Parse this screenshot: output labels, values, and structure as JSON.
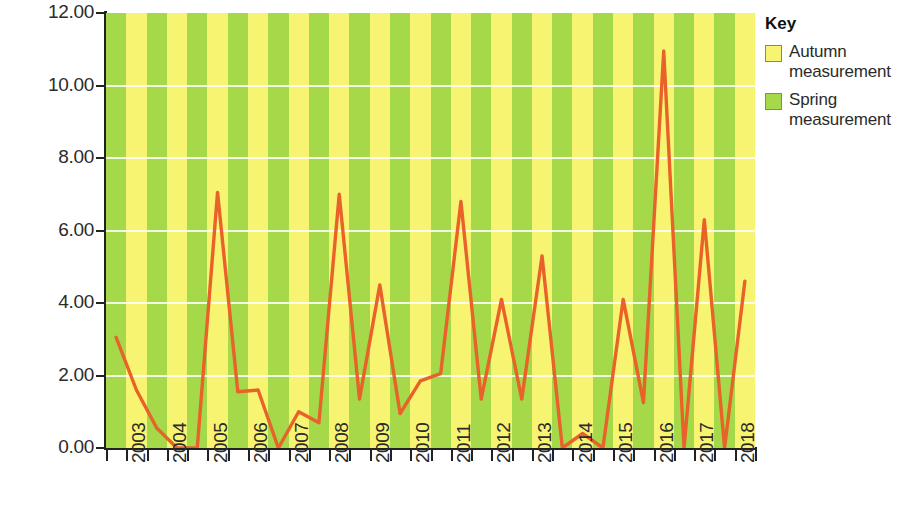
{
  "chart_data": {
    "type": "line",
    "title": "",
    "xlabel": "",
    "ylabel": "Erosion rate (metres per six months)",
    "ylim": [
      0,
      12
    ],
    "ytick_labels": [
      "12.00",
      "10.00",
      "8.00",
      "6.00",
      "4.00",
      "2.00",
      "0.00"
    ],
    "ytick_values": [
      12,
      10,
      8,
      6,
      4,
      2,
      0
    ],
    "xtick_labels": [
      "2003",
      "2004",
      "2005",
      "2006",
      "2007",
      "2008",
      "2009",
      "2010",
      "2011",
      "2012",
      "2013",
      "2014",
      "2015",
      "2016",
      "2017",
      "2018"
    ],
    "grid": true,
    "legend_position": "right",
    "line_color": "#e8622a",
    "band_colors": {
      "spring": "#a5d94a",
      "autumn": "#f7f472"
    },
    "season_order": [
      "Spring",
      "Autumn"
    ],
    "points": [
      {
        "year": "2003",
        "season": "Spring",
        "value": 3.05
      },
      {
        "year": "2003",
        "season": "Autumn",
        "value": 1.6
      },
      {
        "year": "2004",
        "season": "Spring",
        "value": 0.55
      },
      {
        "year": "2004",
        "season": "Autumn",
        "value": 0.0
      },
      {
        "year": "2005",
        "season": "Spring",
        "value": 0.0
      },
      {
        "year": "2005",
        "season": "Autumn",
        "value": 7.05
      },
      {
        "year": "2006",
        "season": "Spring",
        "value": 1.55
      },
      {
        "year": "2006",
        "season": "Autumn",
        "value": 1.6
      },
      {
        "year": "2007",
        "season": "Spring",
        "value": 0.0
      },
      {
        "year": "2007",
        "season": "Autumn",
        "value": 1.0
      },
      {
        "year": "2008",
        "season": "Spring",
        "value": 0.7
      },
      {
        "year": "2008",
        "season": "Autumn",
        "value": 7.0
      },
      {
        "year": "2009",
        "season": "Spring",
        "value": 1.35
      },
      {
        "year": "2009",
        "season": "Autumn",
        "value": 4.5
      },
      {
        "year": "2010",
        "season": "Spring",
        "value": 0.95
      },
      {
        "year": "2010",
        "season": "Autumn",
        "value": 1.85
      },
      {
        "year": "2011",
        "season": "Spring",
        "value": 2.05
      },
      {
        "year": "2011",
        "season": "Autumn",
        "value": 6.8
      },
      {
        "year": "2012",
        "season": "Spring",
        "value": 1.35
      },
      {
        "year": "2012",
        "season": "Autumn",
        "value": 4.1
      },
      {
        "year": "2013",
        "season": "Spring",
        "value": 1.35
      },
      {
        "year": "2013",
        "season": "Autumn",
        "value": 5.3
      },
      {
        "year": "2014",
        "season": "Spring",
        "value": 0.0
      },
      {
        "year": "2014",
        "season": "Autumn",
        "value": 0.4
      },
      {
        "year": "2015",
        "season": "Spring",
        "value": 0.0
      },
      {
        "year": "2015",
        "season": "Autumn",
        "value": 4.1
      },
      {
        "year": "2016",
        "season": "Spring",
        "value": 1.25
      },
      {
        "year": "2016",
        "season": "Autumn",
        "value": 10.95
      },
      {
        "year": "2017",
        "season": "Spring",
        "value": 0.0
      },
      {
        "year": "2017",
        "season": "Autumn",
        "value": 6.3
      },
      {
        "year": "2018",
        "season": "Spring",
        "value": 0.0
      },
      {
        "year": "2018",
        "season": "Autumn",
        "value": 4.6
      }
    ]
  },
  "legend": {
    "title": "Key",
    "entries": [
      {
        "label": "Autumn measurement",
        "color": "#f7f472"
      },
      {
        "label": "Spring measurement",
        "color": "#a5d94a"
      }
    ]
  }
}
